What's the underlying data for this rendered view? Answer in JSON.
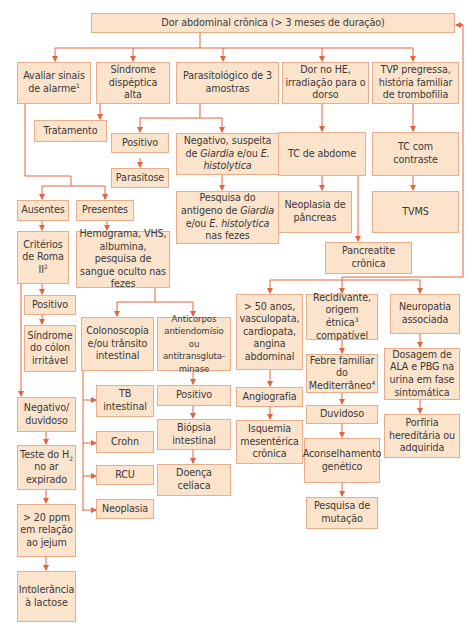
{
  "title": "Dor abdominal crônica (> 3 meses de duração)",
  "colors": {
    "box_fill": "#fbe3cc",
    "box_border": "#e8ae8c",
    "connector": "#e4643f",
    "text": "#3a3a3a"
  },
  "nodes": {
    "root": "Dor abdominal crônica (> 3 meses de duração)",
    "alarme": "Avaliar sinais de alarme",
    "alarme_sup": "1",
    "dispeptica": "Síndrome dispéptica alta",
    "parasito": "Parasitológico de 3 amostras",
    "dor_he": "Dor no HE, irradiação para o dorso",
    "tvp": "TVP pregressa, história familiar de trombofilia",
    "tratamento": "Tratamento",
    "positivo_parasito": "Positivo",
    "parasitose": "Parasitose",
    "negativo_giardia_1": "Negativo, suspeita de",
    "negativo_giardia_2": "Giardia",
    "negativo_giardia_3": "e/ou",
    "negativo_giardia_4": "E. histolytica",
    "antigeno_1": "Pesquisa do antigeno de",
    "antigeno_2": "Giardia",
    "antigeno_3": "e/ou",
    "antigeno_4": "E. histolytica",
    "antigeno_5": "nas fezes",
    "tc_abdome": "TC de abdome",
    "neoplasia_pancreas": "Neoplasia de pâncreas",
    "pancreatite": "Pancreatite crônica",
    "tc_contraste": "TC com contraste",
    "tvms": "TVMS",
    "ausentes": "Ausentes",
    "presentes": "Presentes",
    "roma": "Critérios de Roma II",
    "roma_sup": "2",
    "hemograma": "Hemograma, VHS, albumina, pesquisa de sangue oculto nas fezes",
    "positivo_roma": "Positivo",
    "colon_irritavel": "Síndrome do cólon irritável",
    "colonoscopia": "Colonoscopia e/ou trânsito intestinal",
    "anticorpos": "Anticorpos antiendomísio ou antitransgluta-minase",
    "tb_intestinal": "TB intestinal",
    "crohn": "Crohn",
    "rcu": "RCU",
    "neoplasia": "Neoplasia",
    "positivo_celiaca": "Positivo",
    "biopsia": "Biópsia intestinal",
    "doenca_celiaca": "Doença celíaca",
    "negativo_duvidoso": "Negativo/ duvidoso",
    "teste_h2_a": "Teste do H",
    "teste_h2_sub": "2",
    "teste_h2_b": "no ar expirado",
    "ppm": "> 20 ppm em relação ao jejum",
    "intolerancia": "Intolerância à lactose",
    "mais50": "> 50 anos, vasculopata, cardiopata, angina abdominal",
    "angiografia": "Angiografia",
    "isquemia": "Isquemia mesentérica crônica",
    "recidivante": "Recidivante, origem étnica",
    "recidivante_sup": "3",
    "recidivante_b": "compatível",
    "febre": "Febre familiar do Mediterrâneo",
    "febre_sup": "4",
    "duvidoso": "Duvidoso",
    "aconselhamento": "Aconselhamento genético",
    "pesquisa_mutacao": "Pesquisa de mutação",
    "neuropatia": "Neuropatia associada",
    "dosagem": "Dosagem de ALA e PBG na urina em fase sintomática",
    "porfiria": "Porfiria hereditária ou adquirida"
  }
}
